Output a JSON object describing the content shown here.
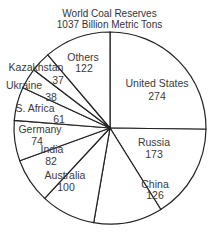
{
  "chart_data": {
    "type": "pie",
    "title": "World Coal Reserves",
    "subtitle": "1037 Billion Metric Tons",
    "start_angle_deg": 0,
    "direction": "clockwise",
    "colors": {
      "fill": "#ffffff",
      "stroke": "#222222",
      "text": "#3a3a3a"
    },
    "categories": [
      "United States",
      "Russia",
      "China",
      "Australia",
      "India",
      "Germany",
      "S. Africa",
      "Ukraine",
      "Kazakhstan",
      "Others"
    ],
    "values": [
      274,
      173,
      126,
      100,
      82,
      74,
      61,
      38,
      37,
      122
    ],
    "labels": [
      {
        "name": "United States",
        "value": "274",
        "x": 157,
        "y": 87,
        "vx": 157,
        "vy": 100
      },
      {
        "name": "Russia",
        "value": "173",
        "x": 154,
        "y": 146,
        "vx": 154,
        "vy": 158
      },
      {
        "name": "China",
        "value": "126",
        "x": 155,
        "y": 188,
        "vx": 155,
        "vy": 199
      },
      {
        "name": "Australia",
        "value": "100",
        "x": 65,
        "y": 179,
        "vx": 66,
        "vy": 191
      },
      {
        "name": "India",
        "value": "82",
        "x": 52,
        "y": 153,
        "vx": 51,
        "vy": 165
      },
      {
        "name": "Germany",
        "value": "74",
        "x": 40,
        "y": 133,
        "vx": 37,
        "vy": 145
      },
      {
        "name": "S. Africa",
        "value": "61",
        "x": 35,
        "y": 112,
        "vx": 59,
        "vy": 123
      },
      {
        "name": "Ukraine",
        "value": "38",
        "x": 24,
        "y": 89,
        "vx": 51,
        "vy": 101
      },
      {
        "name": "Kazakhstan",
        "value": "37",
        "x": 36,
        "y": 71,
        "vx": 58,
        "vy": 84
      },
      {
        "name": "Others",
        "value": "122",
        "x": 83,
        "y": 61,
        "vx": 84,
        "vy": 72
      }
    ],
    "geometry": {
      "cx": 110,
      "cy": 128,
      "r": 96
    }
  }
}
